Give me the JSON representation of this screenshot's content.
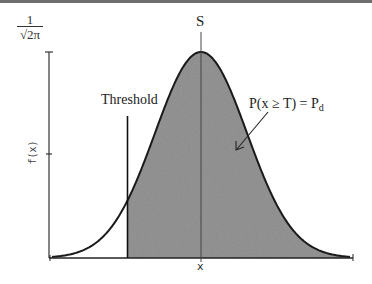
{
  "figure": {
    "type": "gaussian-detection-diagram",
    "y_axis": {
      "max_label_numerator": "1",
      "max_label_denominator": "√2π",
      "label": "f(x)"
    },
    "x_axis": {
      "label": "x"
    },
    "signal_label": "S",
    "threshold_label": "Threshold",
    "probability_label_main": "P(x ≥ T) = P",
    "probability_label_sub": "d",
    "colors": {
      "shade": "#8c8c8c",
      "curve": "#1a1a1a",
      "axis": "#333333",
      "top_bar": "#6e6e6e"
    },
    "geometry": {
      "mean_x_px": 201,
      "threshold_x_px": 127,
      "baseline_y_px": 258,
      "peak_y_px": 52
    }
  }
}
